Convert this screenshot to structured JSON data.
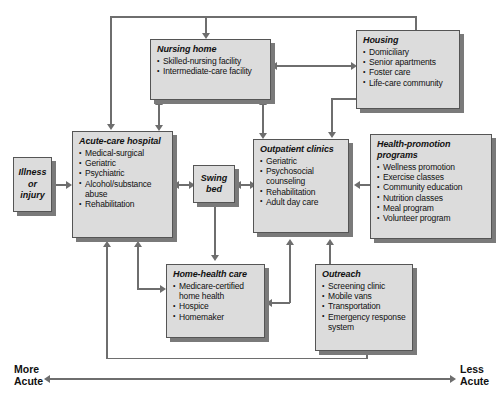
{
  "diagram": {
    "type": "flow-diagram",
    "axis": {
      "left_label_line1": "More",
      "left_label_line2": "Acute",
      "right_label_line1": "Less",
      "right_label_line2": "Acute"
    },
    "colors": {
      "box_fill": "#dcdcdc",
      "box_border": "#555555",
      "box_shadow": "#7a7a7a",
      "connector": "#6e6e6e",
      "text": "#111111"
    },
    "nodes": [
      {
        "id": "illness",
        "title": "Illness\nor\ninjury",
        "line1": "Illness",
        "line2": "or",
        "line3": "injury",
        "items": []
      },
      {
        "id": "acute-care-hospital",
        "title": "Acute-care hospital",
        "items": [
          "Medical-surgical",
          "Geriatric",
          "Psychiatric",
          "Alcohol/substance",
          "abuse",
          "Rehabilitation"
        ]
      },
      {
        "id": "nursing-home",
        "title": "Nursing home",
        "items": [
          "Skilled-nursing facility",
          "Intermediate-care facility"
        ]
      },
      {
        "id": "housing",
        "title": "Housing",
        "items": [
          "Domiciliary",
          "Senior apartments",
          "Foster care",
          "Life-care community"
        ]
      },
      {
        "id": "swing-bed",
        "title": "Swing bed",
        "line1": "Swing",
        "line2": "bed",
        "items": []
      },
      {
        "id": "outpatient-clinics",
        "title": "Outpatient clinics",
        "items": [
          "Geriatric",
          "Psychosocial",
          "counseling",
          "Rehabilitation",
          "Adult day care"
        ]
      },
      {
        "id": "health-promotion-programs",
        "title": "Health-promotion programs",
        "items": [
          "Wellness promotion",
          "Exercise classes",
          "Community education",
          "Nutrition classes",
          "Meal program",
          "Volunteer program"
        ]
      },
      {
        "id": "home-health-care",
        "title": "Home-health care",
        "items": [
          "Medicare-certified",
          "home health",
          "Hospice",
          "Homemaker"
        ]
      },
      {
        "id": "outreach",
        "title": "Outreach",
        "items": [
          "Screening clinic",
          "Mobile vans",
          "Transportation",
          "Emergency response",
          "system"
        ]
      }
    ],
    "edges": [
      {
        "from": "illness",
        "to": "acute-care-hospital",
        "style": "single"
      },
      {
        "from": "acute-care-hospital",
        "to": "swing-bed",
        "style": "double"
      },
      {
        "from": "swing-bed",
        "to": "outpatient-clinics",
        "style": "double"
      },
      {
        "from": "acute-care-hospital",
        "to": "nursing-home",
        "style": "double"
      },
      {
        "from": "nursing-home",
        "to": "housing",
        "style": "double"
      },
      {
        "from": "nursing-home",
        "to": "outpatient-clinics",
        "style": "double"
      },
      {
        "from": "housing",
        "to": "outpatient-clinics",
        "style": "single"
      },
      {
        "from": "health-promotion-programs",
        "to": "outpatient-clinics",
        "style": "single"
      },
      {
        "from": "outreach",
        "to": "outpatient-clinics",
        "style": "single"
      },
      {
        "from": "outreach",
        "to": "home-health-care",
        "style": "single"
      },
      {
        "from": "swing-bed",
        "to": "home-health-care",
        "style": "single"
      },
      {
        "from": "home-health-care",
        "to": "acute-care-hospital",
        "style": "single"
      },
      {
        "from": "outreach",
        "to": "acute-care-hospital",
        "style": "single"
      },
      {
        "from": "nursing-home",
        "to": "acute-care-hospital",
        "style": "routed-top"
      },
      {
        "from": "housing",
        "to": "nursing-home",
        "style": "routed-top"
      }
    ]
  }
}
